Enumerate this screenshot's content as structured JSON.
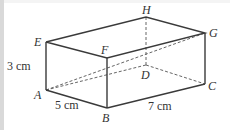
{
  "diagram": {
    "type": "cuboid",
    "vertices": {
      "E": {
        "label": "E",
        "x": 46,
        "y": 42
      },
      "F": {
        "label": "F",
        "x": 107,
        "y": 58
      },
      "G": {
        "label": "G",
        "x": 205,
        "y": 33
      },
      "H": {
        "label": "H",
        "x": 146,
        "y": 17
      },
      "A": {
        "label": "A",
        "x": 46,
        "y": 90
      },
      "B": {
        "label": "B",
        "x": 107,
        "y": 108
      },
      "C": {
        "label": "C",
        "x": 205,
        "y": 84
      },
      "D": {
        "label": "D",
        "x": 146,
        "y": 65
      }
    },
    "visible_edges": [
      "EF",
      "FG",
      "GH",
      "HE",
      "EA",
      "AB",
      "BF",
      "BC",
      "CG"
    ],
    "hidden_edges": [
      "HD",
      "AD",
      "DC",
      "AC",
      "AG"
    ],
    "dimensions": {
      "height": "3 cm",
      "width": "5 cm",
      "length": "7 cm"
    },
    "colors": {
      "line": "#3a3a3a",
      "background": "#ffffff"
    }
  }
}
